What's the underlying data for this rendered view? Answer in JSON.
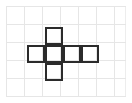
{
  "figure": {
    "title": "Cube net on square grid",
    "canvas": {
      "width": 132,
      "height": 103,
      "background_color": "#ffffff",
      "frame_color": "#ededed"
    },
    "grid": {
      "columns": 6,
      "rows": 5,
      "cell_size": 18,
      "origin_x": 9,
      "origin_y": 9,
      "line_color": "#e6e6e6",
      "visible": true
    },
    "shape": {
      "name": "cube-net-hexomino",
      "stroke_color": "#2b2b2b",
      "stroke_width": 2,
      "fill": "none",
      "cell_size": 18,
      "cell_count": 6,
      "cells": [
        {
          "label": "top",
          "col": 2,
          "row": 1
        },
        {
          "label": "left",
          "col": 1,
          "row": 2
        },
        {
          "label": "center",
          "col": 2,
          "row": 2
        },
        {
          "label": "right",
          "col": 3,
          "row": 2
        },
        {
          "label": "far-right",
          "col": 4,
          "row": 2
        },
        {
          "label": "bottom",
          "col": 2,
          "row": 3
        }
      ]
    }
  }
}
